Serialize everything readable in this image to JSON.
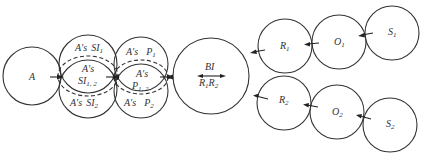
{
  "diagram": {
    "nodes": {
      "A": {
        "label": "A"
      },
      "SI": {
        "top": {
          "prefix": "A's",
          "main": "SI",
          "sub": "1"
        },
        "mid": {
          "prefix": "A's",
          "main": "SI",
          "sub": "1, 2"
        },
        "bottom": {
          "prefix": "A's",
          "main": "SI",
          "sub": "2"
        }
      },
      "P": {
        "top": {
          "prefix": "A's",
          "main": "P",
          "sub": "1"
        },
        "mid": {
          "prefix": "A's",
          "main": "P",
          "sub": "1, 2"
        },
        "bottom": {
          "prefix": "A's",
          "main": "P",
          "sub": "2"
        }
      },
      "BI": {
        "label": "BI",
        "r1": "R",
        "r1_sub": "1",
        "r2": "R",
        "r2_sub": "2"
      },
      "R1": {
        "main": "R",
        "sub": "1"
      },
      "O1": {
        "main": "O",
        "sub": "1"
      },
      "S1": {
        "main": "S",
        "sub": "1"
      },
      "R2": {
        "main": "R",
        "sub": "2"
      },
      "O2": {
        "main": "O",
        "sub": "2"
      },
      "S2": {
        "main": "S",
        "sub": "2"
      }
    },
    "edges": [
      {
        "from": "A",
        "to": "SI"
      },
      {
        "from": "SI",
        "to": "P"
      },
      {
        "from": "P",
        "to": "BI"
      },
      {
        "from": "R1",
        "to": "BI"
      },
      {
        "from": "R2",
        "to": "BI"
      },
      {
        "from": "O1",
        "to": "R1"
      },
      {
        "from": "O2",
        "to": "R2"
      },
      {
        "from": "S1",
        "to": "O1"
      },
      {
        "from": "S2",
        "to": "O2"
      }
    ]
  }
}
